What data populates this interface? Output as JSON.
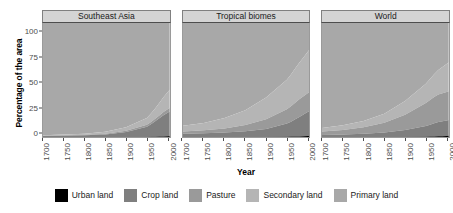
{
  "chart_data": {
    "type": "area",
    "title": "",
    "xlabel": "Year",
    "ylabel": "Percentage of the area",
    "xlim": [
      1700,
      2005
    ],
    "ylim": [
      0,
      100
    ],
    "grid": false,
    "stacked": true,
    "legend_position": "bottom",
    "xticks": [
      "1700",
      "1750",
      "1800",
      "1850",
      "1900",
      "1950",
      "2000"
    ],
    "xtick_values": [
      1700,
      1750,
      1800,
      1850,
      1900,
      1950,
      2000
    ],
    "yticks": [
      "0",
      "25",
      "50",
      "75",
      "100"
    ],
    "ytick_values": [
      0,
      25,
      50,
      75,
      100
    ],
    "series_order": [
      "Urban land",
      "Crop land",
      "Pasture",
      "Secondary land",
      "Primary land"
    ],
    "colors": {
      "Urban land": "#000000",
      "Crop land": "#7f7f7f",
      "Pasture": "#9a9a9a",
      "Secondary land": "#b5b5b5",
      "Primary land": "#a8a8a8"
    },
    "x": [
      1700,
      1750,
      1800,
      1850,
      1900,
      1950,
      1960,
      1970,
      1980,
      1990,
      2000,
      2005
    ],
    "panels": [
      {
        "name": "Southeast Asia",
        "series": [
          {
            "name": "Urban land",
            "values": [
              0.0,
              0.0,
              0.0,
              0.0,
              0.1,
              0.2,
              0.3,
              0.4,
              0.5,
              0.7,
              0.9,
              1.0
            ]
          },
          {
            "name": "Crop land",
            "values": [
              1.0,
              1.2,
              1.6,
              2.4,
              4.5,
              9.0,
              11.0,
              13.5,
              16.0,
              18.5,
              20.5,
              21.5
            ]
          },
          {
            "name": "Pasture",
            "values": [
              0.3,
              0.4,
              0.5,
              0.7,
              1.0,
              1.6,
              1.9,
              2.2,
              2.5,
              2.8,
              3.0,
              3.1
            ]
          },
          {
            "name": "Secondary land",
            "values": [
              0.5,
              0.7,
              1.0,
              1.6,
              3.0,
              6.0,
              7.5,
              9.0,
              11.0,
              13.0,
              15.0,
              16.0
            ]
          },
          {
            "name": "Primary land",
            "values": [
              98.2,
              97.7,
              96.9,
              95.3,
              91.4,
              83.2,
              79.3,
              74.9,
              70.0,
              65.0,
              60.6,
              58.4
            ]
          }
        ]
      },
      {
        "name": "Tropical biomes",
        "series": [
          {
            "name": "Urban land",
            "values": [
              0.0,
              0.0,
              0.1,
              0.1,
              0.2,
              0.4,
              0.5,
              0.6,
              0.7,
              0.8,
              1.0,
              1.1
            ]
          },
          {
            "name": "Crop land",
            "values": [
              3.0,
              3.4,
              4.0,
              5.0,
              7.0,
              11.5,
              13.0,
              15.0,
              17.0,
              19.0,
              21.0,
              22.0
            ]
          },
          {
            "name": "Pasture",
            "values": [
              2.0,
              2.6,
              3.6,
              5.5,
              8.5,
              12.5,
              13.5,
              14.5,
              15.5,
              16.0,
              16.5,
              16.8
            ]
          },
          {
            "name": "Secondary land",
            "values": [
              5.0,
              6.5,
              9.0,
              13.0,
              19.0,
              26.0,
              28.0,
              30.0,
              32.0,
              34.0,
              36.0,
              37.0
            ]
          },
          {
            "name": "Primary land",
            "values": [
              90.0,
              87.5,
              83.3,
              76.4,
              65.3,
              49.6,
              45.0,
              39.9,
              34.8,
              30.2,
              25.5,
              23.1
            ]
          }
        ]
      },
      {
        "name": "World",
        "series": [
          {
            "name": "Urban land",
            "values": [
              0.0,
              0.0,
              0.1,
              0.1,
              0.2,
              0.4,
              0.5,
              0.6,
              0.8,
              0.9,
              1.1,
              1.2
            ]
          },
          {
            "name": "Crop land",
            "values": [
              2.0,
              2.4,
              3.0,
              4.0,
              6.0,
              9.5,
              10.5,
              11.5,
              12.5,
              13.0,
              13.5,
              13.8
            ]
          },
          {
            "name": "Pasture",
            "values": [
              3.0,
              4.0,
              5.5,
              8.5,
              13.5,
              20.0,
              21.5,
              23.0,
              24.0,
              24.5,
              25.0,
              25.2
            ]
          },
          {
            "name": "Secondary land",
            "values": [
              3.0,
              4.0,
              5.5,
              8.0,
              12.0,
              17.0,
              18.5,
              20.0,
              21.5,
              23.0,
              24.5,
              25.3
            ]
          },
          {
            "name": "Primary land",
            "values": [
              92.0,
              89.6,
              85.9,
              79.4,
              68.3,
              53.1,
              49.0,
              44.9,
              41.2,
              38.6,
              35.9,
              34.5
            ]
          }
        ]
      }
    ]
  },
  "panels": [
    {
      "title": "Southeast Asia"
    },
    {
      "title": "Tropical biomes"
    },
    {
      "title": "World"
    }
  ],
  "axes": {
    "y_title": "Percentage of the area",
    "x_title": "Year",
    "y_ticks": [
      "100",
      "75",
      "50",
      "25",
      "0"
    ],
    "x_ticks": [
      "1700",
      "1750",
      "1800",
      "1850",
      "1900",
      "1950",
      "2000"
    ]
  },
  "legend": {
    "items": [
      {
        "label": "Urban land",
        "color": "#000000"
      },
      {
        "label": "Crop land",
        "color": "#7f7f7f"
      },
      {
        "label": "Pasture",
        "color": "#9a9a9a"
      },
      {
        "label": "Secondary land",
        "color": "#b5b5b5"
      },
      {
        "label": "Primary land",
        "color": "#a8a8a8"
      }
    ]
  }
}
